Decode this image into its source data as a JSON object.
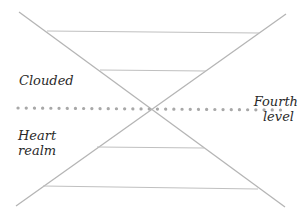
{
  "labels": {
    "upper_left": "Clouded",
    "lower_left_line1": "Heart",
    "lower_left_line2": "realm",
    "right_line1": "Fourth",
    "right_line2": "level"
  },
  "colors": {
    "line": "#b5b5b5",
    "dots": "#a8a8a8",
    "text": "#2a2a2a"
  }
}
